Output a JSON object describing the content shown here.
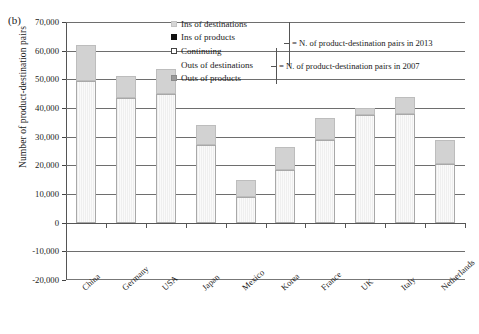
{
  "panel": {
    "label": "(b)"
  },
  "axes": {
    "ylabel": "Number of product-destination pairs",
    "yticks": [
      "70,000",
      "60,000",
      "50,000",
      "40,000",
      "30,000",
      "20,000",
      "10,000",
      "0",
      "-10,000",
      "-20,000"
    ]
  },
  "legend": {
    "items": [
      {
        "key": "ins-dest",
        "label": "Ins of destinations"
      },
      {
        "key": "ins-prod",
        "label": "Ins of products"
      },
      {
        "key": "cont",
        "label": "Continuing"
      },
      {
        "key": "out-dest",
        "label": "Outs of destinations"
      },
      {
        "key": "out-prod",
        "label": "Outs of products"
      }
    ]
  },
  "annotations": {
    "top": "= N. of product-destination pairs in 2013",
    "bottom": "= N. of product-destination pairs in 2007"
  },
  "chart_data": {
    "type": "bar",
    "title": "",
    "xlabel": "",
    "ylabel": "Number of product-destination pairs",
    "ylim": [
      -20000,
      70000
    ],
    "ytick_step": 10000,
    "grid": true,
    "stacked": true,
    "legend_position": "top-right",
    "categories": [
      "China",
      "Germany",
      "USA",
      "Japan",
      "Mexico",
      "Korea",
      "France",
      "UK",
      "Italy",
      "Netherlands"
    ],
    "series": [
      {
        "name": "Continuing",
        "values": [
          49500,
          43500,
          45000,
          27000,
          9000,
          18500,
          29000,
          37500,
          38000,
          20500
        ]
      },
      {
        "name": "Ins of destinations",
        "values": [
          12500,
          7500,
          8500,
          7000,
          6000,
          8000,
          7500,
          2500,
          6000,
          8500
        ]
      },
      {
        "name": "Ins of products",
        "values": [
          0,
          0,
          0,
          0,
          0,
          0,
          0,
          0,
          0,
          0
        ]
      },
      {
        "name": "Outs of destinations",
        "values": [
          0,
          0,
          0,
          0,
          0,
          0,
          0,
          0,
          0,
          0
        ]
      },
      {
        "name": "Outs of products",
        "values": [
          0,
          0,
          0,
          0,
          0,
          0,
          0,
          0,
          0,
          0
        ]
      }
    ],
    "totals_2013": [
      62000,
      51000,
      53500,
      34000,
      15000,
      26500,
      36500,
      40000,
      44000,
      29000
    ]
  }
}
